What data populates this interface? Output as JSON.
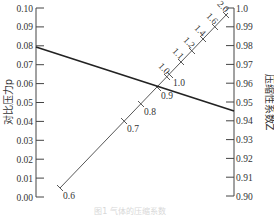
{
  "chart_data": {
    "type": "nomogram",
    "title": "",
    "caption": "图1 气体的压缩系数",
    "left_axis": {
      "label": "对比压力p",
      "min": 0.0,
      "max": 0.1,
      "ticks": [
        "0.00",
        "0.01",
        "0.02",
        "0.03",
        "0.04",
        "0.05",
        "0.06",
        "0.07",
        "0.08",
        "0.09",
        "0.10"
      ]
    },
    "right_axis": {
      "label": "压缩性系数Z",
      "min": 0.9,
      "max": 1.0,
      "ticks": [
        "0.90",
        "0.91",
        "0.92",
        "0.93",
        "0.94",
        "0.95",
        "0.96",
        "0.97",
        "0.98",
        "0.99",
        "1.0"
      ]
    },
    "diagonal_scale": {
      "lower_side_ticks": [
        "0.6",
        "0.7",
        "0.8",
        "0.9",
        "1.0"
      ],
      "upper_side_ticks": [
        "1.0",
        "1.1",
        "1.2",
        "1.4",
        "1.6",
        "2.0"
      ]
    },
    "isopleth": {
      "left_value": 0.078,
      "diagonal_value": 0.9,
      "right_value": 0.945
    }
  }
}
